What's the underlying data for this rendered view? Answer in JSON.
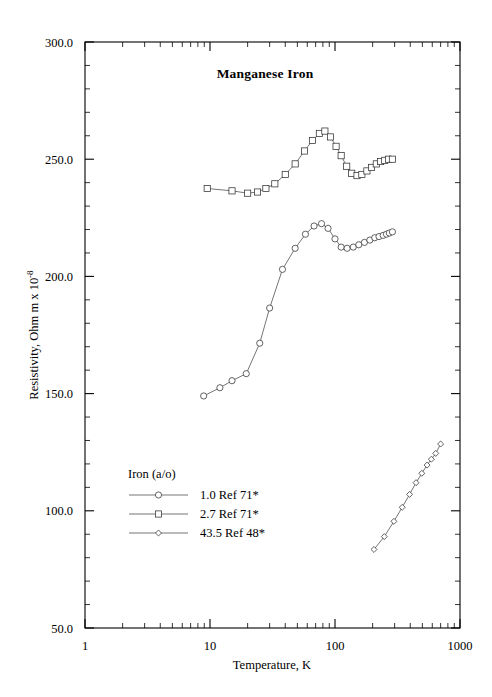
{
  "chart_data": {
    "type": "line",
    "title": "Manganese Iron",
    "xlabel": "Temperature,  K",
    "ylabel_main": "Resistivity, Ohm m x 10",
    "ylabel_exponent": "-8",
    "xscale": "log",
    "yscale": "linear",
    "xlim": [
      1,
      1000
    ],
    "ylim": [
      50.0,
      300.0
    ],
    "grid": false,
    "xticks": [
      1,
      10,
      100,
      1000
    ],
    "xtick_labels": [
      "1",
      "10",
      "100",
      "1000"
    ],
    "yticks": [
      50.0,
      100.0,
      150.0,
      200.0,
      250.0,
      300.0
    ],
    "ytick_labels": [
      "50.0",
      "100.0",
      "150.0",
      "200.0",
      "250.0",
      "300.0"
    ],
    "ytick_minor_step": 10,
    "legend_position": "lower-left-inside",
    "legend_title": "Iron (a/o)",
    "series": [
      {
        "name": "1.0 Ref 71*",
        "marker": "circle",
        "points": [
          [
            8.9,
            149.0
          ],
          [
            12.0,
            152.5
          ],
          [
            15.0,
            155.5
          ],
          [
            19.5,
            158.5
          ],
          [
            25.0,
            171.5
          ],
          [
            30.0,
            186.5
          ],
          [
            38.0,
            203.0
          ],
          [
            48.0,
            212.0
          ],
          [
            58.0,
            218.0
          ],
          [
            68.0,
            221.5
          ],
          [
            78.0,
            222.5
          ],
          [
            88.0,
            220.5
          ],
          [
            100.0,
            216.0
          ],
          [
            112.0,
            212.5
          ],
          [
            125.0,
            212.0
          ],
          [
            140.0,
            212.5
          ],
          [
            155.0,
            213.5
          ],
          [
            172.0,
            214.5
          ],
          [
            190.0,
            215.5
          ],
          [
            208.0,
            216.5
          ],
          [
            225.0,
            217.0
          ],
          [
            243.0,
            217.5
          ],
          [
            258.0,
            218.0
          ],
          [
            272.0,
            218.5
          ],
          [
            288.0,
            219.0
          ]
        ]
      },
      {
        "name": "2.7 Ref 71*",
        "marker": "square",
        "points": [
          [
            9.5,
            237.5
          ],
          [
            15.0,
            236.5
          ],
          [
            20.0,
            235.5
          ],
          [
            24.0,
            236.0
          ],
          [
            28.0,
            237.5
          ],
          [
            33.0,
            239.5
          ],
          [
            40.0,
            243.5
          ],
          [
            48.0,
            248.0
          ],
          [
            57.0,
            253.5
          ],
          [
            66.0,
            258.0
          ],
          [
            75.0,
            261.0
          ],
          [
            83.0,
            262.0
          ],
          [
            92.0,
            259.5
          ],
          [
            102.0,
            255.5
          ],
          [
            112.0,
            251.5
          ],
          [
            124.0,
            247.0
          ],
          [
            136.0,
            244.0
          ],
          [
            150.0,
            243.0
          ],
          [
            164.0,
            243.5
          ],
          [
            180.0,
            245.0
          ],
          [
            196.0,
            246.5
          ],
          [
            214.0,
            248.0
          ],
          [
            232.0,
            249.0
          ],
          [
            250.0,
            249.5
          ],
          [
            268.0,
            250.0
          ],
          [
            288.0,
            250.0
          ]
        ]
      },
      {
        "name": "43.5 Ref 48*",
        "marker": "diamond",
        "points": [
          [
            205.0,
            83.5
          ],
          [
            248.0,
            89.0
          ],
          [
            296.0,
            95.5
          ],
          [
            345.0,
            101.5
          ],
          [
            395.0,
            107.0
          ],
          [
            445.0,
            112.0
          ],
          [
            495.0,
            116.0
          ],
          [
            545.0,
            119.5
          ],
          [
            590.0,
            122.0
          ],
          [
            640.0,
            124.5
          ],
          [
            700.0,
            128.5
          ]
        ]
      }
    ]
  }
}
